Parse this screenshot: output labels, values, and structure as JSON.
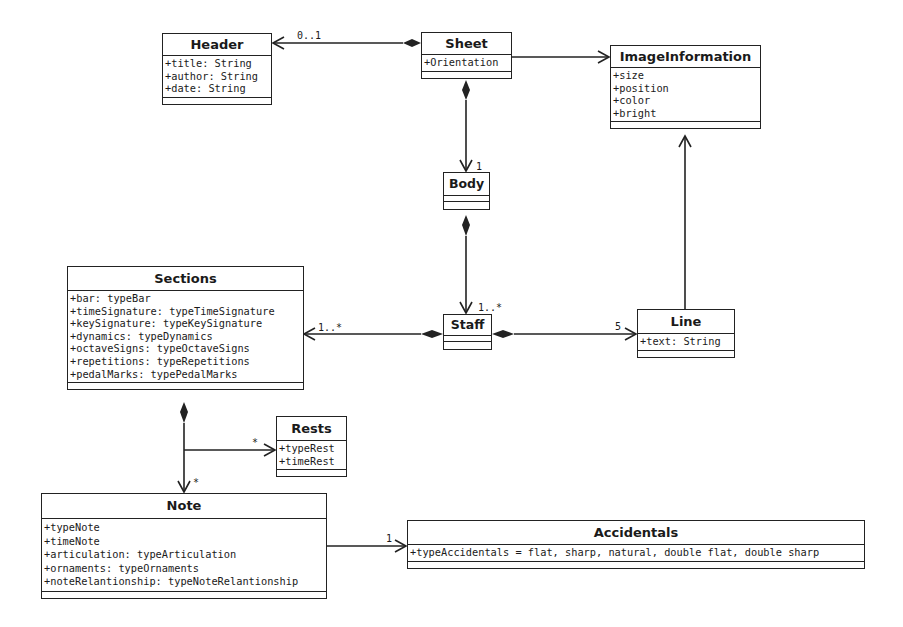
{
  "diagram": {
    "type": "UML class diagram",
    "classes": {
      "header": {
        "name": "Header",
        "attributes": [
          "+title: String",
          "+author: String",
          "+date: String"
        ]
      },
      "sheet": {
        "name": "Sheet",
        "attributes": [
          "+Orientation"
        ]
      },
      "image_information": {
        "name": "ImageInformation",
        "attributes": [
          "+size",
          "+position",
          "+color",
          "+bright"
        ]
      },
      "body": {
        "name": "Body",
        "attributes": []
      },
      "sections": {
        "name": "Sections",
        "attributes": [
          "+bar: typeBar",
          "+timeSignature: typeTimeSignature",
          "+keySignature: typeKeySignature",
          "+dynamics: typeDynamics",
          "+octaveSigns: typeOctaveSigns",
          "+repetitions: typeRepetitions",
          "+pedalMarks: typePedalMarks"
        ]
      },
      "staff": {
        "name": "Staff",
        "attributes": []
      },
      "line": {
        "name": "Line",
        "attributes": [
          "+text: String"
        ]
      },
      "rests": {
        "name": "Rests",
        "attributes": [
          "+typeRest",
          "+timeRest"
        ]
      },
      "note": {
        "name": "Note",
        "attributes": [
          "+typeNote",
          "+timeNote",
          "+articulation: typeArticulation",
          "+ornaments: typeOrnaments",
          "+noteRelantionship: typeNoteRelantionship"
        ]
      },
      "accidentals": {
        "name": "Accidentals",
        "attributes": [
          "+typeAccidentals = flat, sharp, natural, double flat, double sharp"
        ]
      }
    },
    "relationships": [
      {
        "from": "Sheet",
        "to": "Header",
        "kind": "composition",
        "multiplicity": "0..1"
      },
      {
        "from": "Sheet",
        "to": "ImageInformation",
        "kind": "association",
        "multiplicity": ""
      },
      {
        "from": "Sheet",
        "to": "Body",
        "kind": "composition",
        "multiplicity": "1"
      },
      {
        "from": "Body",
        "to": "Staff",
        "kind": "composition",
        "multiplicity": "1..*"
      },
      {
        "from": "Staff",
        "to": "Sections",
        "kind": "composition",
        "multiplicity": "1..*"
      },
      {
        "from": "Staff",
        "to": "Line",
        "kind": "composition",
        "multiplicity": "5"
      },
      {
        "from": "Line",
        "to": "ImageInformation",
        "kind": "association",
        "multiplicity": ""
      },
      {
        "from": "Sections",
        "to": "Note",
        "kind": "composition",
        "multiplicity": "*"
      },
      {
        "from": "Sections",
        "to": "Rests",
        "kind": "composition",
        "multiplicity": "*"
      },
      {
        "from": "Note",
        "to": "Accidentals",
        "kind": "association",
        "multiplicity": "1"
      }
    ],
    "multiplicity_labels": {
      "header": "0..1",
      "body": "1",
      "staff": "1..*",
      "sections": "1..*",
      "line": "5",
      "rests": "*",
      "note": "*",
      "accidentals": "1"
    }
  }
}
